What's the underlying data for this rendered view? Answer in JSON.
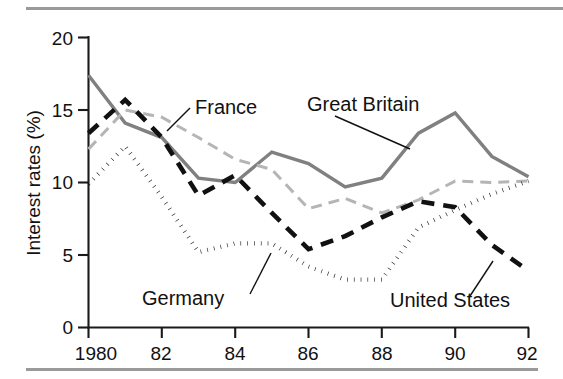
{
  "figure": {
    "rule_color": "#9a9a9a",
    "background": "#ffffff"
  },
  "axes": {
    "y_title": "Interest rates (%)",
    "y_ticks": [
      "0",
      "5",
      "10",
      "15",
      "20"
    ],
    "x_ticks": [
      "1980",
      "82",
      "84",
      "86",
      "88",
      "90",
      "92"
    ]
  },
  "annotations": {
    "france": "France",
    "great_britain": "Great Britain",
    "germany": "Germany",
    "united_states": "United States"
  },
  "chart_data": {
    "type": "line",
    "title": "",
    "xlabel": "",
    "ylabel": "Interest rates (%)",
    "xlim": [
      1980,
      1992
    ],
    "ylim": [
      0,
      20
    ],
    "grid": false,
    "legend": "inline-annotations",
    "x": [
      1980,
      1981,
      1982,
      1983,
      1984,
      1985,
      1986,
      1987,
      1988,
      1989,
      1990,
      1991,
      1992
    ],
    "series": [
      {
        "name": "Great Britain",
        "color": "#808080",
        "style": "solid",
        "values": [
          17.4,
          14.1,
          13.1,
          10.3,
          10.0,
          12.1,
          11.3,
          9.7,
          10.3,
          13.4,
          14.8,
          11.8,
          10.4
        ]
      },
      {
        "name": "France",
        "color": "#b5b5b5",
        "style": "dashed",
        "values": [
          12.3,
          15.0,
          14.5,
          13.1,
          11.6,
          10.9,
          8.2,
          8.9,
          7.9,
          8.8,
          10.1,
          10.0,
          10.1
        ]
      },
      {
        "name": "United States",
        "color": "#111111",
        "style": "dashed",
        "values": [
          13.4,
          15.7,
          13.1,
          9.1,
          10.5,
          7.9,
          5.4,
          6.3,
          7.6,
          8.7,
          8.3,
          5.7,
          3.9
        ]
      },
      {
        "name": "Germany",
        "color": "#111111",
        "style": "dotted",
        "values": [
          9.9,
          12.5,
          9.0,
          5.2,
          5.8,
          5.8,
          4.2,
          3.3,
          3.3,
          6.9,
          8.1,
          9.2,
          10.1
        ]
      }
    ]
  }
}
